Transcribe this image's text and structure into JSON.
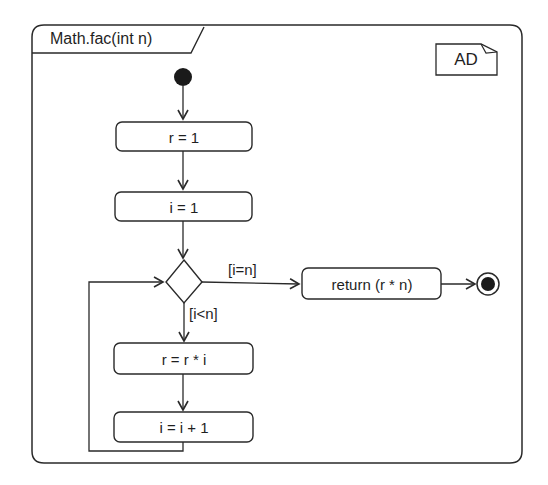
{
  "diagram": {
    "type": "UML activity diagram",
    "frame_title": "Math.fac(int n)",
    "frame_tag": "AD",
    "nodes": {
      "start": "initial-node",
      "action_r_init": "r = 1",
      "action_i_init": "i = 1",
      "decision": "decision-node",
      "action_return": "return (r * n)",
      "action_r_mult": "r = r * i",
      "action_i_inc": "i = i + 1",
      "end": "final-node"
    },
    "guards": {
      "eq": "[i=n]",
      "lt": "[i<n]"
    },
    "edges": [
      {
        "from": "start",
        "to": "action_r_init"
      },
      {
        "from": "action_r_init",
        "to": "action_i_init"
      },
      {
        "from": "action_i_init",
        "to": "decision"
      },
      {
        "from": "decision",
        "to": "action_return",
        "guard": "[i=n]"
      },
      {
        "from": "action_return",
        "to": "end"
      },
      {
        "from": "decision",
        "to": "action_r_mult",
        "guard": "[i<n]"
      },
      {
        "from": "action_r_mult",
        "to": "action_i_inc"
      },
      {
        "from": "action_i_inc",
        "to": "decision"
      }
    ],
    "colors": {
      "stroke": "#2a2a2a",
      "fill": "#ffffff",
      "node_fill": "#1a1a1a",
      "background": "#ffffff"
    }
  }
}
